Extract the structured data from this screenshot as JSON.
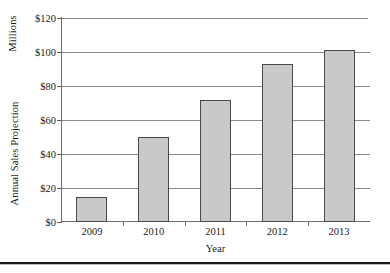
{
  "chart_data": {
    "type": "bar",
    "title": "",
    "categories": [
      "2009",
      "2010",
      "2011",
      "2012",
      "2013"
    ],
    "values": [
      15,
      50,
      72,
      93,
      101
    ],
    "xlabel": "Year",
    "ylabel": "Annual Sales Projection",
    "ylabel_secondary": "Millions",
    "ytick_labels": [
      "$0",
      "$20",
      "$40",
      "$60",
      "$80",
      "$100",
      "$120"
    ],
    "ytick_values": [
      0,
      20,
      40,
      60,
      80,
      100,
      120
    ],
    "ylim": [
      0,
      120
    ],
    "grid": "horizontal",
    "legend": "none",
    "bar_fill_color": "#c9c9c9",
    "bar_border_color": "#4a4a4a",
    "gridline_color": "#8a8a8a",
    "axis_color": "#6f6f6f",
    "background_color": "#ffffff"
  },
  "axis": {
    "y_group_label_top": "Millions",
    "y_group_label_bottom": "Annual Sales Projection",
    "x_title": "Year"
  }
}
